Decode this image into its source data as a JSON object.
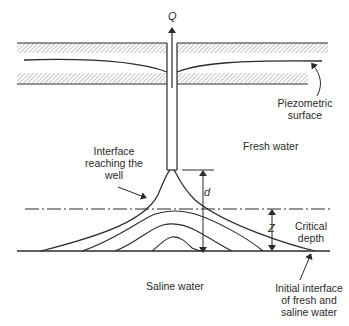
{
  "diagram": {
    "symbols": {
      "discharge": "Q",
      "well_to_interface": "d",
      "critical_rise": "Z"
    },
    "labels": {
      "piezometric_line1": "Piezometric",
      "piezometric_line2": "surface",
      "fresh_water": "Fresh water",
      "interface_line1": "Interface",
      "interface_line2": "reaching the",
      "interface_line3": "well",
      "critical_line1": "Critical",
      "critical_line2": "depth",
      "saline_water": "Saline water",
      "initial_line1": "Initial interface",
      "initial_line2": "of fresh and",
      "initial_line3": "saline water"
    },
    "colors": {
      "line": "#2a2a2a",
      "hatch": "#8a8a8a",
      "background": "#ffffff"
    }
  }
}
